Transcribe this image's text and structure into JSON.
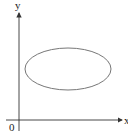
{
  "diagram": {
    "axes": {
      "x_label": "x",
      "y_label": "y",
      "origin_label": "0"
    },
    "shapes": [
      {
        "type": "ellipse",
        "description": "closed elliptical curve in first quadrant"
      }
    ],
    "colors": {
      "axis": "#333333",
      "curve": "#777777",
      "text": "#222222"
    }
  }
}
